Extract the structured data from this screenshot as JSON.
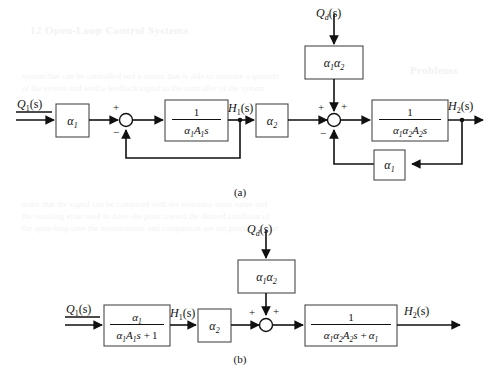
{
  "figure": {
    "background_color": "#ffffff",
    "line_color": "#111111",
    "box_stroke_color": "#4a4a4a",
    "ghost_text_color": "#f2f2f2"
  },
  "ghost_text": {
    "heading": "12 Open-Loop Control Systems",
    "side_heading": "Problems",
    "lines": [
      "system that can be controlled and a sensor that is able to measure a quantity",
      "of the system and send a feedback signal to the controller of the system",
      "order that the signal can be compared with the reference input value and",
      "the resulting error used to drive the plant toward the desired condition of",
      "the open-loop case the measurement and comparison are not present so that"
    ]
  },
  "diagrams": [
    {
      "id": "a",
      "caption": "(a)",
      "signals": {
        "input": "Q₁(s)",
        "disturbance": "Q_d(s)",
        "intermediate": "H₁(s)",
        "output": "H₂(s)"
      },
      "blocks": [
        {
          "name": "alpha1-gain",
          "label": "α₁",
          "type": "gain"
        },
        {
          "name": "integrator-1",
          "numerator": "1",
          "denominator": "α₁A₁s",
          "type": "fraction"
        },
        {
          "name": "alpha2-gain",
          "label": "α₂",
          "type": "gain"
        },
        {
          "name": "disturbance-gain",
          "label": "α₁α₂",
          "type": "gain"
        },
        {
          "name": "integrator-2",
          "numerator": "1",
          "denominator": "α₁α₂A₂s",
          "type": "fraction"
        },
        {
          "name": "feedback-gain",
          "label": "α₁",
          "type": "gain"
        }
      ],
      "summing_junctions": [
        {
          "name": "summing-junction-1",
          "signs": [
            "+",
            "−"
          ]
        },
        {
          "name": "summing-junction-2",
          "signs": [
            "+",
            "+",
            "−"
          ]
        }
      ]
    },
    {
      "id": "b",
      "caption": "(b)",
      "signals": {
        "input": "Q₁(s)",
        "disturbance": "Q_d(s)",
        "intermediate": "H₁(s)",
        "output": "H₂(s)"
      },
      "blocks": [
        {
          "name": "first-order-lag",
          "numerator": "α₁",
          "denominator": "α₁A₁s + 1",
          "type": "fraction"
        },
        {
          "name": "alpha2-gain",
          "label": "α₂",
          "type": "gain"
        },
        {
          "name": "disturbance-gain",
          "label": "α₁α₂",
          "type": "gain"
        },
        {
          "name": "second-order-lag",
          "numerator": "1",
          "denominator": "α₁α₂A₂s + α₁",
          "type": "fraction"
        }
      ],
      "summing_junctions": [
        {
          "name": "summing-junction-1",
          "signs": [
            "+",
            "+"
          ]
        }
      ]
    }
  ],
  "labels": {
    "q1_main": "Q",
    "q1_sub": "1",
    "q_paren": "(s)",
    "qd_main": "Q",
    "qd_sub": "d",
    "h1_main": "H",
    "h1_sub": "1",
    "h2_main": "H",
    "h2_sub": "2",
    "alpha": "α",
    "sub1": "1",
    "sub2": "2",
    "A": "A",
    "s": "s",
    "one": "1",
    "plus": "+",
    "minus": "−",
    "plus_one": "1",
    "alpha1_text": "α₁",
    "alpha2_text": "α₂",
    "alpha1alpha2_text": "α₁α₂"
  }
}
